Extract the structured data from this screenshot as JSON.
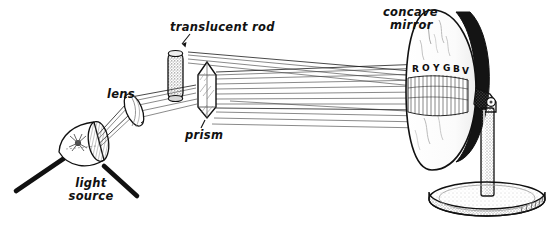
{
  "figure": {
    "background_color": "#ffffff",
    "ink_color": "#111111",
    "width": 558,
    "height": 229
  },
  "labels": {
    "translucent_rod": "translucent rod",
    "lens": "lens",
    "prism": "prism",
    "light_source_line1": "light",
    "light_source_line2": "source",
    "concave_mirror_line1": "concave",
    "concave_mirror_line2": "mirror"
  },
  "spectrum": {
    "letters": [
      "R",
      "O",
      "Y",
      "G",
      "B",
      "V"
    ],
    "description": "spectrum band on mirror face"
  },
  "components": [
    {
      "name": "light-source",
      "label": "light source"
    },
    {
      "name": "lens",
      "label": "lens"
    },
    {
      "name": "translucent-rod",
      "label": "translucent rod"
    },
    {
      "name": "prism",
      "label": "prism"
    },
    {
      "name": "concave-mirror",
      "label": "concave mirror"
    },
    {
      "name": "mirror-stand",
      "label": ""
    }
  ]
}
